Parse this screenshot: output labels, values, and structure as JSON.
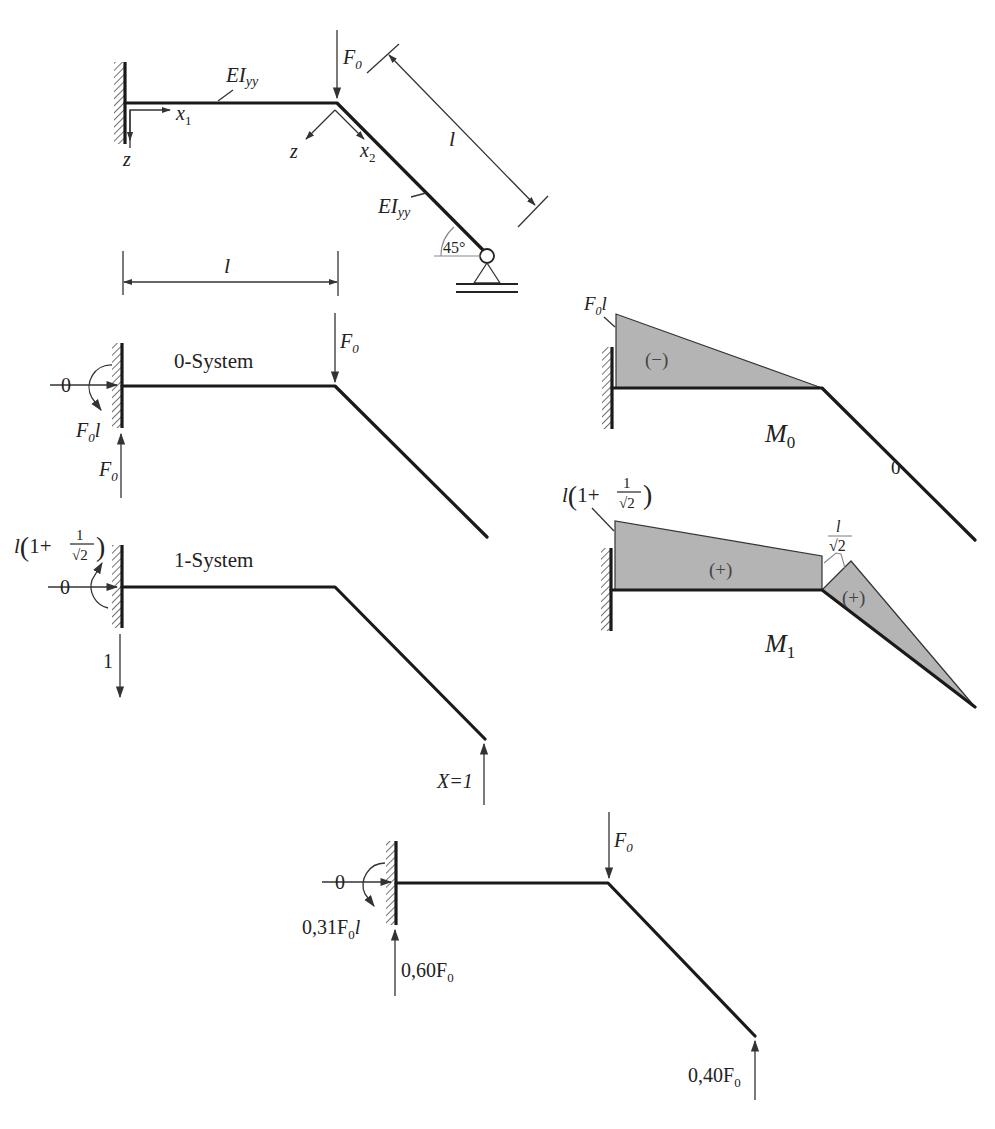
{
  "figure": {
    "type": "structural-mechanics-diagram"
  },
  "original_system": {
    "load_label": "F",
    "load_sub": "0",
    "stiffness_label_1": "EI",
    "stiffness_sub_1": "yy",
    "stiffness_label_2": "EI",
    "stiffness_sub_2": "yy",
    "axis_x1": "x",
    "axis_x1_sub": "1",
    "axis_z1": "z",
    "axis_z2": "z",
    "axis_x2": "x",
    "axis_x2_sub": "2",
    "length_horizontal": "l",
    "length_inclined": "l",
    "angle": "45°"
  },
  "zero_system": {
    "title": "0-System",
    "load_label": "F",
    "load_sub": "0",
    "horizontal_reaction": "0",
    "moment_reaction": "F",
    "moment_reaction_sub": "0",
    "moment_reaction_tail": "l",
    "vertical_reaction": "F",
    "vertical_reaction_sub": "0"
  },
  "one_system": {
    "title": "1-System",
    "horizontal_reaction": "0",
    "moment_prefix": "l",
    "moment_paren_open": "(",
    "moment_one": "1+",
    "moment_frac_num": "1",
    "moment_frac_den": "√2",
    "moment_paren_close": ")",
    "vertical_reaction": "1",
    "redundant_label": "X=1"
  },
  "moment_diagram_0": {
    "title": "M",
    "title_sub": "0",
    "max_value": "F",
    "max_value_sub": "0",
    "max_value_tail": "l",
    "sign": "(−)",
    "inclined_value": "0"
  },
  "moment_diagram_1": {
    "title": "M",
    "title_sub": "1",
    "max_prefix": "l",
    "max_paren_open": "(",
    "max_one": "1+",
    "max_frac_num": "1",
    "max_frac_den": "√2",
    "max_paren_close": ")",
    "corner_frac_num": "l",
    "corner_frac_den": "√2",
    "sign_horizontal": "(+)",
    "sign_inclined": "(+)"
  },
  "final_system": {
    "load_label": "F",
    "load_sub": "0",
    "horizontal_reaction": "0",
    "moment_reaction": "0,31F",
    "moment_reaction_sub": "0",
    "moment_reaction_tail": "l",
    "vertical_reaction": "0,60F",
    "vertical_reaction_sub": "0",
    "support_reaction": "0,40F",
    "support_reaction_sub": "0"
  },
  "colors": {
    "beam": "#1a1a1a",
    "moment_fill": "#b4b4b4",
    "annotation_gray": "#888888"
  }
}
